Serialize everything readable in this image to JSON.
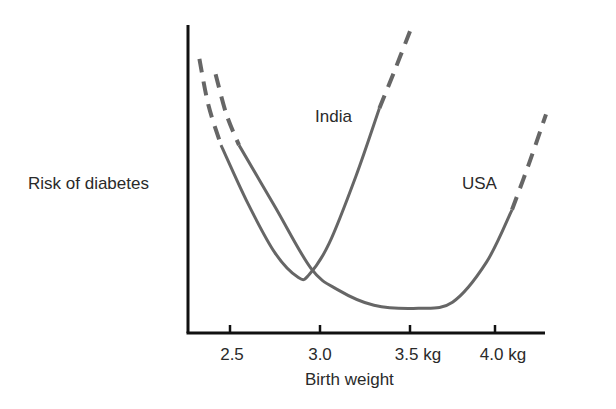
{
  "chart_data": {
    "type": "line",
    "title": "",
    "xlabel": "Birth weight",
    "ylabel": "Risk of diabetes",
    "x_ticks": [
      {
        "value": 2.5,
        "label": "2.5"
      },
      {
        "value": 3.0,
        "label": "3.0"
      },
      {
        "value": 3.5,
        "label": "3.5 kg"
      },
      {
        "value": 4.0,
        "label": "4.0 kg"
      }
    ],
    "xlim": [
      2.27,
      4.3
    ],
    "ylim": [
      0,
      100
    ],
    "y_ticks": [],
    "grid": false,
    "legend": "none (curves labeled inline)",
    "series": [
      {
        "name": "India",
        "color": "#666666",
        "label_position": {
          "x": 3.0,
          "y": 68
        },
        "points": [
          {
            "x": 2.33,
            "y": 89,
            "style": "dashed"
          },
          {
            "x": 2.38,
            "y": 74,
            "style": "dashed"
          },
          {
            "x": 2.45,
            "y": 61,
            "style": "solid"
          },
          {
            "x": 2.6,
            "y": 42
          },
          {
            "x": 2.75,
            "y": 26
          },
          {
            "x": 2.88,
            "y": 18
          },
          {
            "x": 2.94,
            "y": 19
          },
          {
            "x": 3.05,
            "y": 29
          },
          {
            "x": 3.2,
            "y": 51
          },
          {
            "x": 3.33,
            "y": 73,
            "style": "solid-end"
          },
          {
            "x": 3.42,
            "y": 86,
            "style": "dashed"
          },
          {
            "x": 3.5,
            "y": 98,
            "style": "dashed"
          }
        ]
      },
      {
        "name": "USA",
        "color": "#666666",
        "label_position": {
          "x": 4.0,
          "y": 49
        },
        "points": [
          {
            "x": 2.42,
            "y": 84,
            "style": "dashed"
          },
          {
            "x": 2.48,
            "y": 71,
            "style": "dashed"
          },
          {
            "x": 2.55,
            "y": 61,
            "style": "solid"
          },
          {
            "x": 2.75,
            "y": 41
          },
          {
            "x": 2.95,
            "y": 21
          },
          {
            "x": 3.1,
            "y": 14
          },
          {
            "x": 3.3,
            "y": 9
          },
          {
            "x": 3.55,
            "y": 8
          },
          {
            "x": 3.75,
            "y": 10
          },
          {
            "x": 3.95,
            "y": 23
          },
          {
            "x": 4.1,
            "y": 40,
            "style": "solid-end"
          },
          {
            "x": 4.2,
            "y": 55,
            "style": "dashed"
          },
          {
            "x": 4.3,
            "y": 71,
            "style": "dashed"
          }
        ]
      }
    ],
    "annotations": [
      {
        "text": "India",
        "near": "India curve right branch"
      },
      {
        "text": "USA",
        "near": "USA curve right branch"
      }
    ]
  },
  "labels": {
    "ylabel": "Risk of diabetes",
    "xlabel": "Birth weight",
    "india": "India",
    "usa": "USA",
    "tick_0": "2.5",
    "tick_1": "3.0",
    "tick_2": "3.5 kg",
    "tick_3": "4.0 kg"
  },
  "colors": {
    "axis": "#111111",
    "curve": "#666666",
    "text": "#2a2a2a",
    "background": "#ffffff"
  }
}
